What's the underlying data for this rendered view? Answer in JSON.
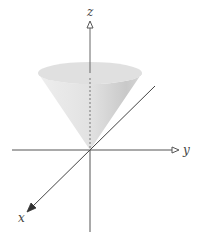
{
  "diagram": {
    "type": "3d-axes-with-cone",
    "axes": {
      "x": {
        "label": "x"
      },
      "y": {
        "label": "y"
      },
      "z": {
        "label": "z"
      }
    },
    "colors": {
      "axis": "#555555",
      "cone_light": "#e6e6e6",
      "cone_dark": "#c8c8c8",
      "cone_top": "#dcdcdc",
      "background": "#ffffff"
    }
  }
}
